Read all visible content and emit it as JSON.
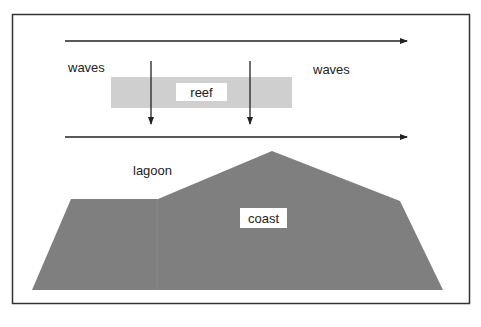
{
  "diagram": {
    "labels": {
      "waves_left": "waves",
      "waves_right": "waves",
      "reef": "reef",
      "lagoon": "lagoon",
      "coast": "coast"
    },
    "colors": {
      "frame": "#333333",
      "arrow": "#222222",
      "reef_fill": "#cfcfcf",
      "coast_fill": "#7f7f7f",
      "label_bg": "#ffffff",
      "background": "#ffffff"
    }
  }
}
